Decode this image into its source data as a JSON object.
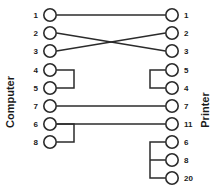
{
  "diagram": {
    "left_side_label": "Computer",
    "right_side_label": "Printer",
    "stroke_color": "#2b2b2b",
    "background_color": "#ffffff",
    "left_pins": [
      {
        "label": "1",
        "x": 50,
        "y": 15
      },
      {
        "label": "2",
        "x": 50,
        "y": 33
      },
      {
        "label": "3",
        "x": 50,
        "y": 51
      },
      {
        "label": "4",
        "x": 50,
        "y": 70
      },
      {
        "label": "5",
        "x": 50,
        "y": 88
      },
      {
        "label": "7",
        "x": 50,
        "y": 106
      },
      {
        "label": "6",
        "x": 50,
        "y": 124
      },
      {
        "label": "8",
        "x": 50,
        "y": 142
      }
    ],
    "right_pins": [
      {
        "label": "1",
        "x": 172,
        "y": 15
      },
      {
        "label": "2",
        "x": 172,
        "y": 33
      },
      {
        "label": "3",
        "x": 172,
        "y": 51
      },
      {
        "label": "5",
        "x": 172,
        "y": 70
      },
      {
        "label": "4",
        "x": 172,
        "y": 88
      },
      {
        "label": "7",
        "x": 172,
        "y": 106
      },
      {
        "label": "11",
        "x": 172,
        "y": 124
      },
      {
        "label": "6",
        "x": 172,
        "y": 142
      },
      {
        "label": "8",
        "x": 172,
        "y": 160
      },
      {
        "label": "20",
        "x": 172,
        "y": 178
      }
    ],
    "connections": [
      {
        "name": "wire-1-to-1",
        "from": "1",
        "to": "1",
        "path": "M 56.5 15 L 165.5 15"
      },
      {
        "name": "wire-2-to-3",
        "from": "2",
        "to": "3",
        "path": "M 56.5 33 L 165.5 51"
      },
      {
        "name": "wire-3-to-2",
        "from": "3",
        "to": "2",
        "path": "M 56.5 51 L 165.5 33"
      },
      {
        "name": "wire-7-to-7",
        "from": "7",
        "to": "7",
        "path": "M 56.5 106 L 165.5 106"
      },
      {
        "name": "wire-6-to-11",
        "from": "6",
        "to": "11",
        "path": "M 56.5 124 L 165.5 124"
      }
    ],
    "jumpers": [
      {
        "name": "jumper-left-4-5",
        "pins": "4-5",
        "path": "M 56.5 70 L 74 70 L 74 88 L 56.5 88"
      },
      {
        "name": "jumper-left-6-8",
        "pins": "6-8",
        "path": "M 56.5 124 L 74 124 L 74 142 L 56.5 142"
      },
      {
        "name": "jumper-right-5-4",
        "pins": "5-4",
        "path": "M 165.5 70 L 150 70 L 150 88 L 165.5 88"
      },
      {
        "name": "jumper-right-6-8-20",
        "pins": "6-8-20",
        "path": "M 165.5 142 L 150 142 L 150 178 L 165.5 178 M 150 160 L 165.5 160"
      }
    ],
    "pin_radius": 6.2
  }
}
